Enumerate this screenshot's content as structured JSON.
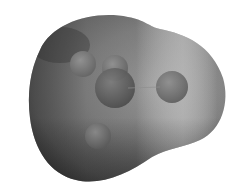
{
  "image": {
    "subject": "molecular-electrostatic-potential-surface",
    "background_color": "#ffffff",
    "surface": {
      "base_color": "#8a8a8a",
      "shadow_color": "#3f3f3f",
      "highlight_color": "#bdbdbd"
    },
    "atoms": [
      {
        "name": "central-atom",
        "cx": 115,
        "cy": 88,
        "r": 20,
        "color": "#5c5c5c"
      },
      {
        "name": "upper-atom",
        "cx": 115,
        "cy": 68,
        "r": 13,
        "color": "#777777"
      },
      {
        "name": "left-upper-atom",
        "cx": 83,
        "cy": 64,
        "r": 13,
        "color": "#7a7a7a"
      },
      {
        "name": "right-atom",
        "cx": 172,
        "cy": 87,
        "r": 16,
        "color": "#727272"
      },
      {
        "name": "lower-left-atom",
        "cx": 98,
        "cy": 136,
        "r": 13,
        "color": "#6e6e6e"
      }
    ]
  }
}
